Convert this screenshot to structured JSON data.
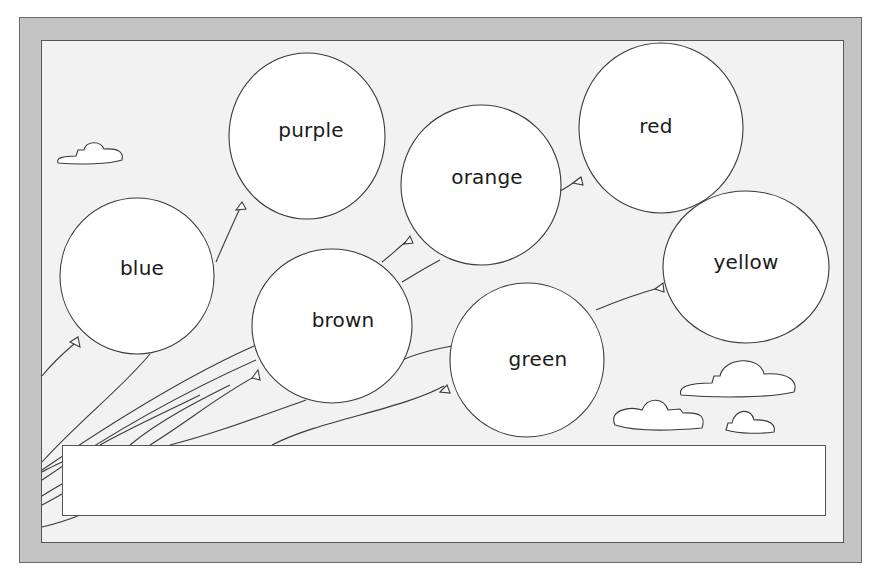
{
  "worksheet": {
    "title": "Color word balloons",
    "balloons": [
      {
        "label": "blue",
        "cx": 137,
        "cy": 276,
        "rx": 77,
        "ry": 78,
        "label_x": 142,
        "label_y": 268
      },
      {
        "label": "purple",
        "cx": 307,
        "cy": 136,
        "rx": 78,
        "ry": 83,
        "label_x": 311,
        "label_y": 130
      },
      {
        "label": "orange",
        "cx": 481,
        "cy": 185,
        "rx": 80,
        "ry": 80,
        "label_x": 487,
        "label_y": 177
      },
      {
        "label": "red",
        "cx": 661,
        "cy": 128,
        "rx": 82,
        "ry": 85,
        "label_x": 656,
        "label_y": 126
      },
      {
        "label": "yellow",
        "cx": 746,
        "cy": 267,
        "rx": 83,
        "ry": 76,
        "label_x": 746,
        "label_y": 262
      },
      {
        "label": "brown",
        "cx": 332,
        "cy": 326,
        "rx": 80,
        "ry": 77,
        "label_x": 343,
        "label_y": 320
      },
      {
        "label": "green",
        "cx": 527,
        "cy": 360,
        "rx": 77,
        "ry": 77,
        "label_x": 538,
        "label_y": 359
      }
    ],
    "answer_box": {
      "value": ""
    }
  },
  "colors": {
    "frame": "#c4c4c4",
    "panel": "#f2f2f2",
    "balloon_fill": "#ffffff",
    "stroke": "#3a3a3a"
  }
}
